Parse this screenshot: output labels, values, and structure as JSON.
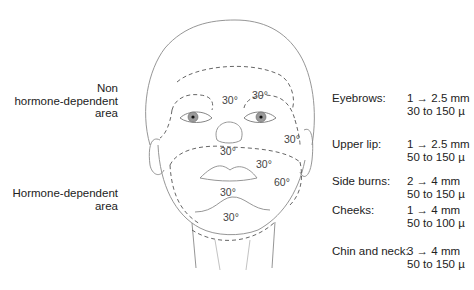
{
  "labels": {
    "non_hormone": [
      "Non",
      "hormone-dependent",
      "area"
    ],
    "hormone": [
      "Hormone-dependent",
      "area"
    ]
  },
  "angles": {
    "forehead_left": "30°",
    "forehead_right": "30°",
    "temple_right": "30°",
    "upper_lip": "30°",
    "cheek_right": "30°",
    "sideburn_right": "60°",
    "chin": "30°",
    "neck": "30°"
  },
  "legend": [
    {
      "region": "Eyebrows:",
      "depth": "1 → 2.5 mm",
      "diameter": "30 to 150 µ"
    },
    {
      "region": "Upper lip:",
      "depth": "1 → 2.5 mm",
      "diameter": "50 to 150 µ"
    },
    {
      "region": "Side burns:",
      "depth": "2 → 4 mm",
      "diameter": "50 to 150 µ"
    },
    {
      "region": "Cheeks:",
      "depth": "1 → 4 mm",
      "diameter": "50 to 100 µ"
    },
    {
      "region": "Chin and neck:",
      "depth": "3 → 4 mm",
      "diameter": "50 to 150 µ"
    }
  ],
  "colors": {
    "outline": "#8a8a8a",
    "dashed": "#555555",
    "iris": "#9a9a9a",
    "text": "#222222"
  }
}
